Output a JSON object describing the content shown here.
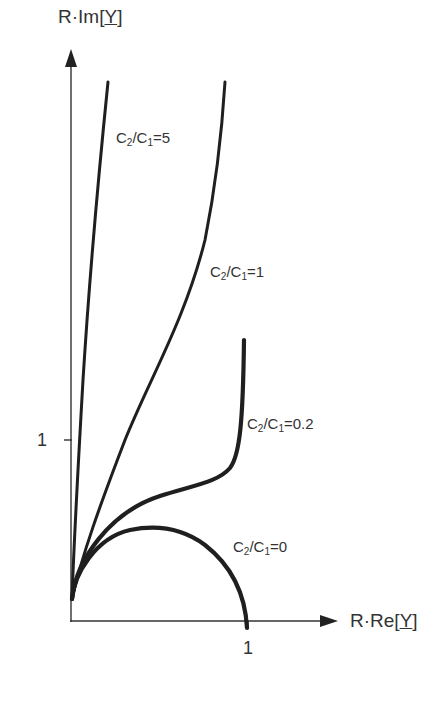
{
  "chart_data": {
    "type": "line",
    "title": "",
    "xlabel": "R·Re[Y]",
    "ylabel": "R·Im[Y]",
    "x_ticks": [
      {
        "value": 1,
        "label": "1"
      }
    ],
    "y_ticks": [
      {
        "value": 1,
        "label": "1"
      }
    ],
    "xlim": [
      0,
      1.5
    ],
    "ylim": [
      0,
      3.15
    ],
    "grid": false,
    "legend": "inline labels",
    "series": [
      {
        "name": "C2/C1=0",
        "label_main": "C",
        "label_sub1": "2",
        "label_mid": "/C",
        "label_sub2": "1",
        "label_tail": "=0",
        "description": "semicircle from (0,0) to (1,0), peak 0.5 at x≈0.5",
        "points": [
          [
            0,
            0.12
          ],
          [
            0.05,
            0.28
          ],
          [
            0.15,
            0.42
          ],
          [
            0.3,
            0.5
          ],
          [
            0.5,
            0.51
          ],
          [
            0.65,
            0.47
          ],
          [
            0.8,
            0.37
          ],
          [
            0.92,
            0.22
          ],
          [
            0.99,
            0.0
          ]
        ]
      },
      {
        "name": "C2/C1=0.2",
        "label_main": "C",
        "label_sub1": "2",
        "label_mid": "/C",
        "label_sub2": "1",
        "label_tail": "=0.2",
        "description": "rises, plateaus near 0.75-0.8, then turns sharply upward near x≈0.95",
        "points": [
          [
            0,
            0.12
          ],
          [
            0.05,
            0.3
          ],
          [
            0.15,
            0.5
          ],
          [
            0.3,
            0.63
          ],
          [
            0.5,
            0.72
          ],
          [
            0.7,
            0.78
          ],
          [
            0.84,
            0.83
          ],
          [
            0.9,
            0.88
          ],
          [
            0.93,
            0.95
          ],
          [
            0.95,
            1.15
          ],
          [
            0.96,
            1.4
          ],
          [
            0.97,
            1.55
          ]
        ]
      },
      {
        "name": "C2/C1=1",
        "label_main": "C",
        "label_sub1": "2",
        "label_mid": "/C",
        "label_sub2": "1",
        "label_tail": "=1",
        "description": "monotonic increasing, steepening toward top",
        "points": [
          [
            0,
            0.12
          ],
          [
            0.05,
            0.35
          ],
          [
            0.1,
            0.6
          ],
          [
            0.2,
            0.95
          ],
          [
            0.3,
            1.3
          ],
          [
            0.45,
            1.8
          ],
          [
            0.58,
            2.3
          ],
          [
            0.68,
            2.75
          ],
          [
            0.75,
            2.99
          ]
        ]
      },
      {
        "name": "C2/C1=5",
        "label_main": "C",
        "label_sub1": "2",
        "label_mid": "/C",
        "label_sub2": "1",
        "label_tail": "=5",
        "description": "nearly straight steep line close to the imaginary axis",
        "points": [
          [
            0,
            0.12
          ],
          [
            0.02,
            0.35
          ],
          [
            0.05,
            0.9
          ],
          [
            0.1,
            1.9
          ],
          [
            0.15,
            2.6
          ],
          [
            0.21,
            2.99
          ]
        ]
      }
    ],
    "pixel_mapping": {
      "origin_x": 71,
      "origin_y": 621,
      "px_per_unit_x": 177,
      "px_per_unit_y": 181
    },
    "curve_paths": {
      "c0": "M72,599 C74,575 95,538 130,530 C155,525 182,528 205,545 C228,563 245,590 247,628",
      "c02": "M72,599 C76,560 110,512 160,496 C195,485 218,482 230,468 C240,455 243,420 244,340",
      "c1": "M72,599 C82,555 100,505 125,440 C150,378 185,320 205,240 C215,190 222,130 225,82",
      "c5": "M72,599 C74,540 79,450 83,380 C88,300 96,200 108,82"
    },
    "curve_widths": {
      "c0": 4.2,
      "c02": 4.2,
      "c1": 3.0,
      "c5": 3.0
    },
    "label_positions": {
      "c5": {
        "left": 116,
        "top": 130
      },
      "c1": {
        "left": 210,
        "top": 264
      },
      "c02": {
        "left": 247,
        "top": 416
      },
      "c0": {
        "left": 233,
        "top": 539
      }
    }
  },
  "axes": {
    "y_title_prefix": "R·Im[",
    "y_title_var": "Y",
    "y_title_suffix": "]",
    "x_title_prefix": "R·Re[",
    "x_title_var": "Y",
    "x_title_suffix": "]",
    "x_tick_label": "1",
    "y_tick_label": "1"
  },
  "colors": {
    "ink": "#1f1f1f",
    "axis": "#333333",
    "background": "#ffffff"
  }
}
